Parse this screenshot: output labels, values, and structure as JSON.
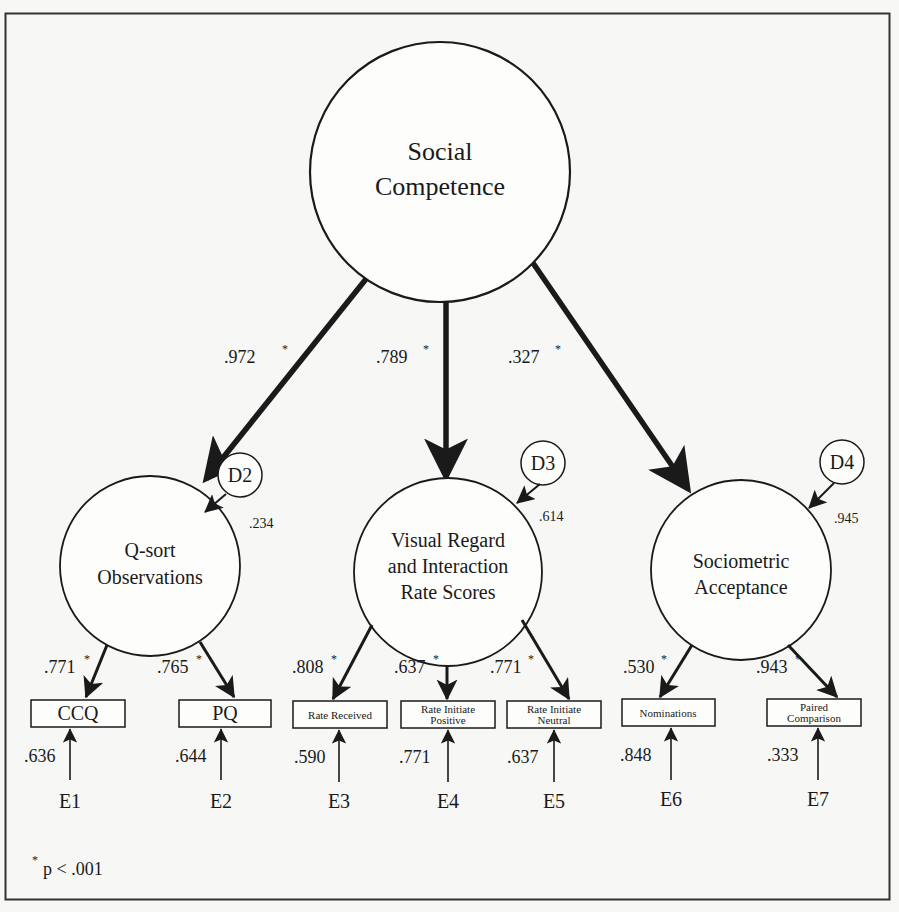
{
  "diagram": {
    "type": "structural-equation-model",
    "frame_color": "#333333",
    "ink_color": "#1a1a1a",
    "background": "#f7f7f5",
    "latent_factor": {
      "label_line1": "Social",
      "label_line2": "Competence"
    },
    "first_order_factors": [
      {
        "id": "qsort",
        "label_lines": [
          "Q-sort",
          "Observations"
        ],
        "loading": ".972",
        "loading_sig": "*",
        "disturbance": "D2",
        "disturbance_value": ".234"
      },
      {
        "id": "visual",
        "label_lines": [
          "Visual Regard",
          "and Interaction",
          "Rate Scores"
        ],
        "loading": ".789",
        "loading_sig": "*",
        "disturbance": "D3",
        "disturbance_value": ".614"
      },
      {
        "id": "sociometric",
        "label_lines": [
          "Sociometric",
          "Acceptance"
        ],
        "loading": ".327",
        "loading_sig": "*",
        "disturbance": "D4",
        "disturbance_value": ".945"
      }
    ],
    "indicators": [
      {
        "label_lines": [
          "CCQ"
        ],
        "loading": ".771",
        "sig": "*",
        "error": "E1",
        "error_value": ".636"
      },
      {
        "label_lines": [
          "PQ"
        ],
        "loading": ".765",
        "sig": "*",
        "error": "E2",
        "error_value": ".644"
      },
      {
        "label_lines": [
          "Rate Received"
        ],
        "loading": ".808",
        "sig": "*",
        "error": "E3",
        "error_value": ".590"
      },
      {
        "label_lines": [
          "Rate Initiate",
          "Positive"
        ],
        "loading": ".637",
        "sig": "*",
        "error": "E4",
        "error_value": ".771"
      },
      {
        "label_lines": [
          "Rate Initiate",
          "Neutral"
        ],
        "loading": ".771",
        "sig": "*",
        "error": "E5",
        "error_value": ".637"
      },
      {
        "label_lines": [
          "Nominations"
        ],
        "loading": ".530",
        "sig": "*",
        "error": "E6",
        "error_value": ".848"
      },
      {
        "label_lines": [
          "Paired",
          "Comparison"
        ],
        "loading": ".943",
        "sig": "*",
        "error": "E7",
        "error_value": ".333"
      }
    ],
    "footnote": {
      "symbol": "*",
      "text": "p < .001"
    }
  }
}
